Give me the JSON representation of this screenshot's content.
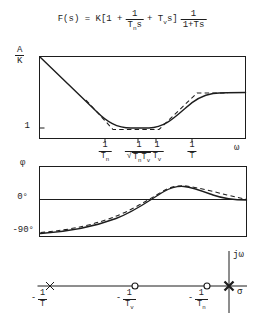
{
  "colors": {
    "ink": "#1d1d1d",
    "paper": "#ffffff"
  },
  "formula": {
    "prefix": "F(s) = K[1 +",
    "frac1_num": "1",
    "frac1_den_base": "T",
    "frac1_den_sub": "n",
    "frac1_den_tail": "s",
    "mid_base": "+ T",
    "mid_sub": "v",
    "mid_tail": "s]",
    "frac2_num": "1",
    "frac2_den": "1+Ts"
  },
  "magnitude_plot": {
    "ylabel_num": "A",
    "ylabel_den": "K",
    "ytick_one": "1",
    "xtick1": {
      "num": "1",
      "den_base": "T",
      "den_sub": "n"
    },
    "xtick2": {
      "num": "1",
      "sign": "√",
      "base1": "T",
      "sub1": "n",
      "base2": "T",
      "sub2": "v"
    },
    "xtick3": {
      "num": "1",
      "den_base": "T",
      "den_sub": "v"
    },
    "xtick4": {
      "num": "1",
      "den_base": "T"
    },
    "omega_label": "ω"
  },
  "phase_plot": {
    "ylabel": "φ",
    "tick_zero": "0°",
    "tick_minus90": "-90°"
  },
  "pole_zero": {
    "jw_label": "jω",
    "sigma_label": "σ",
    "labels": [
      {
        "minus": "-",
        "num": "1",
        "den_base": "T",
        "den_sub": ""
      },
      {
        "minus": "-",
        "num": "1",
        "den_base": "T",
        "den_sub": "v"
      },
      {
        "minus": "-",
        "num": "1",
        "den_base": "T",
        "den_sub": "n"
      }
    ]
  }
}
